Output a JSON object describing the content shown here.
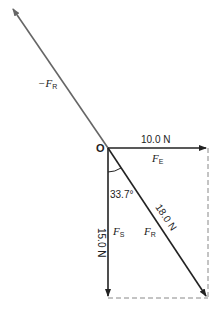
{
  "diagram": {
    "type": "vector-force-diagram",
    "origin_label": "O",
    "vectors": [
      {
        "id": "FE",
        "symbol": "F",
        "subscript": "E",
        "magnitude_label": "10.0 N",
        "direction": "east"
      },
      {
        "id": "FS",
        "symbol": "F",
        "subscript": "S",
        "magnitude_label": "15.0 N",
        "direction": "south"
      },
      {
        "id": "FR",
        "symbol": "F",
        "subscript": "R",
        "magnitude_label": "18.0 N",
        "direction": "south-east (resultant)"
      },
      {
        "id": "neg_FR",
        "symbol": "−F",
        "subscript": "R",
        "magnitude_label": "",
        "direction": "north-west (equilibrant)"
      }
    ],
    "angle_label": "33.7°",
    "colors": {
      "primary_arrow": "#222222",
      "equilibrant_arrow": "#666666",
      "dashed": "#888888"
    }
  },
  "labels": {
    "o": "O",
    "fe_mag": "10.0 N",
    "fe_sym": "F",
    "fe_sub": "E",
    "fs_mag": "15.0 N",
    "fs_sym": "F",
    "fs_sub": "S",
    "fr_mag": "18.0 N",
    "fr_sym": "F",
    "fr_sub": "R",
    "neg_sym": "−F",
    "neg_sub": "R",
    "angle": "33.7°"
  }
}
